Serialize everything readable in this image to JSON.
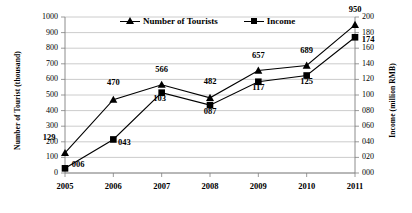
{
  "chart_data": {
    "type": "line",
    "title": "",
    "xlabel": "",
    "categories": [
      "2005",
      "2006",
      "2007",
      "2008",
      "2009",
      "2010",
      "2011"
    ],
    "series": [
      {
        "name": "Number of Tourists",
        "marker": "triangle",
        "axis": "left",
        "values": [
          129,
          470,
          566,
          482,
          657,
          689,
          950
        ],
        "labels": [
          "129",
          "470",
          "566",
          "482",
          "657",
          "689",
          "950"
        ]
      },
      {
        "name": "Income",
        "marker": "square",
        "axis": "right",
        "values": [
          6,
          43,
          103,
          87,
          117,
          125,
          174
        ],
        "labels": [
          "006",
          "043",
          "103",
          "087",
          "117",
          "125",
          "174"
        ]
      }
    ],
    "left_axis": {
      "label": "Number of Tourist (thousand)",
      "ylim": [
        0,
        1000
      ],
      "step": 100,
      "ticks": [
        "0",
        "100",
        "200",
        "300",
        "400",
        "500",
        "600",
        "700",
        "800",
        "900",
        "1000"
      ]
    },
    "right_axis": {
      "label": "Income (million RMB)",
      "ylim": [
        0,
        200
      ],
      "step": 20,
      "ticks": [
        "000",
        "020",
        "040",
        "060",
        "080",
        "100",
        "120",
        "140",
        "160",
        "180",
        "200"
      ]
    },
    "grid": true,
    "legend_position": "top-center",
    "colors": {
      "line": "#000000",
      "grid": "#bfbfbf",
      "axis": "#808080",
      "background": "#ffffff"
    }
  },
  "legend": {
    "items": [
      {
        "label": "Number of Tourists"
      },
      {
        "label": "Income"
      }
    ]
  }
}
